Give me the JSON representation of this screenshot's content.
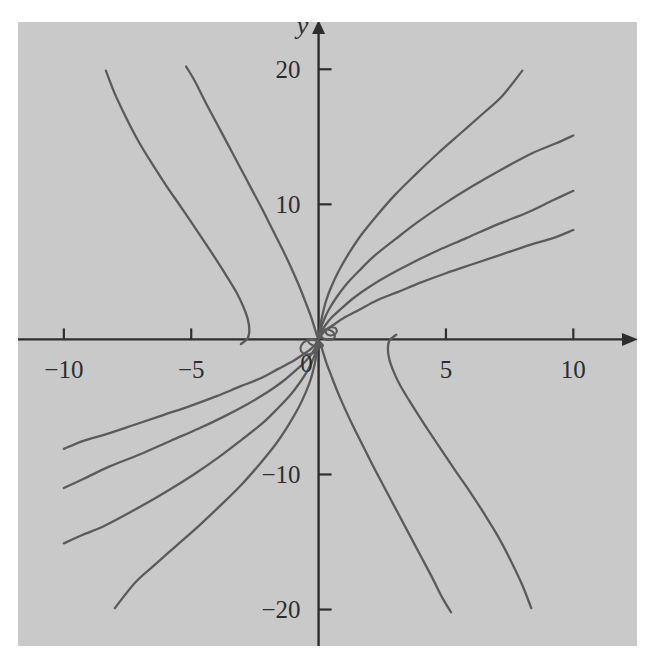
{
  "figure": {
    "background_color": "#ffffff",
    "plot_background_color": "#c9c9c9",
    "axis_color": "#2e2e2e",
    "curve_color": "#5b5b5b"
  },
  "axes": {
    "x_axis_label": "x",
    "y_axis_label": "y",
    "origin_label": "0",
    "x_ticks": [
      {
        "value": -10,
        "label": "−10"
      },
      {
        "value": -5,
        "label": "−5"
      },
      {
        "value": 5,
        "label": "5"
      },
      {
        "value": 10,
        "label": "10"
      }
    ],
    "y_ticks": [
      {
        "value": 20,
        "label": "20"
      },
      {
        "value": 10,
        "label": "10"
      },
      {
        "value": -10,
        "label": "−10"
      },
      {
        "value": -20,
        "label": "−20"
      }
    ]
  },
  "chart_data": {
    "type": "line",
    "title": "",
    "xlabel": "x",
    "ylabel": "y",
    "xlim": [
      -11.8,
      12.5
    ],
    "ylim": [
      -22.7,
      23.5
    ],
    "grid": false,
    "legend": null,
    "series": [
      {
        "name": "branch-1-upper-right",
        "comment": "steepest branch from origin to (8, 20)",
        "points": [
          [
            0.02,
            0.35
          ],
          [
            0.06,
            0.9
          ],
          [
            0.15,
            1.8
          ],
          [
            0.3,
            2.9
          ],
          [
            0.5,
            3.9
          ],
          [
            0.8,
            5.1
          ],
          [
            1.2,
            6.4
          ],
          [
            1.7,
            7.8
          ],
          [
            2.3,
            9.2
          ],
          [
            3.0,
            10.7
          ],
          [
            3.8,
            12.2
          ],
          [
            4.7,
            13.8
          ],
          [
            5.6,
            15.3
          ],
          [
            6.5,
            16.8
          ],
          [
            7.2,
            18.0
          ],
          [
            8.0,
            19.9
          ]
        ]
      },
      {
        "name": "branch-2-upper-right",
        "comment": "from origin to (10, 15)",
        "points": [
          [
            0.02,
            0.2
          ],
          [
            0.08,
            0.7
          ],
          [
            0.2,
            1.4
          ],
          [
            0.4,
            2.2
          ],
          [
            0.7,
            3.1
          ],
          [
            1.1,
            4.1
          ],
          [
            1.6,
            5.1
          ],
          [
            2.2,
            6.2
          ],
          [
            3.0,
            7.4
          ],
          [
            3.9,
            8.7
          ],
          [
            4.9,
            10.0
          ],
          [
            6.0,
            11.3
          ],
          [
            7.2,
            12.6
          ],
          [
            8.4,
            13.8
          ],
          [
            9.3,
            14.5
          ],
          [
            10.0,
            15.1
          ]
        ]
      },
      {
        "name": "branch-3-upper-right",
        "comment": "from origin to (10, 11)",
        "points": [
          [
            0.02,
            0.1
          ],
          [
            0.1,
            0.5
          ],
          [
            0.25,
            1.0
          ],
          [
            0.5,
            1.6
          ],
          [
            0.9,
            2.3
          ],
          [
            1.4,
            3.1
          ],
          [
            2.0,
            3.9
          ],
          [
            2.8,
            4.8
          ],
          [
            3.7,
            5.7
          ],
          [
            4.7,
            6.6
          ],
          [
            5.8,
            7.5
          ],
          [
            7.0,
            8.5
          ],
          [
            8.2,
            9.4
          ],
          [
            9.2,
            10.3
          ],
          [
            10.0,
            11.0
          ]
        ]
      },
      {
        "name": "branch-4-upper-right",
        "comment": "from origin to (10, 8)",
        "points": [
          [
            0.02,
            0.05
          ],
          [
            0.12,
            0.35
          ],
          [
            0.3,
            0.7
          ],
          [
            0.6,
            1.1
          ],
          [
            1.0,
            1.6
          ],
          [
            1.6,
            2.2
          ],
          [
            2.3,
            2.9
          ],
          [
            3.1,
            3.5
          ],
          [
            4.0,
            4.2
          ],
          [
            5.0,
            4.9
          ],
          [
            6.1,
            5.6
          ],
          [
            7.2,
            6.3
          ],
          [
            8.3,
            7.0
          ],
          [
            9.2,
            7.5
          ],
          [
            10.0,
            8.1
          ]
        ]
      },
      {
        "name": "branch-fold-right",
        "comment": "fold branch: vertical tangent near x = 2.7 on x-axis, descends to (8, -20)",
        "points": [
          [
            3.05,
            0.35
          ],
          [
            2.78,
            -0.1
          ],
          [
            2.72,
            -0.7
          ],
          [
            2.78,
            -1.5
          ],
          [
            2.95,
            -2.4
          ],
          [
            3.2,
            -3.4
          ],
          [
            3.55,
            -4.5
          ],
          [
            3.95,
            -5.7
          ],
          [
            4.4,
            -7.0
          ],
          [
            4.9,
            -8.4
          ],
          [
            5.4,
            -9.8
          ],
          [
            5.95,
            -11.3
          ],
          [
            6.5,
            -12.9
          ],
          [
            7.05,
            -14.6
          ],
          [
            7.55,
            -16.4
          ],
          [
            8.0,
            -18.2
          ],
          [
            8.35,
            -19.9
          ]
        ]
      },
      {
        "name": "branch-steep-right-down",
        "comment": "from origin steeply down to (5, -20)",
        "points": [
          [
            0.05,
            -0.2
          ],
          [
            0.15,
            -0.8
          ],
          [
            0.3,
            -1.7
          ],
          [
            0.5,
            -2.7
          ],
          [
            0.75,
            -3.9
          ],
          [
            1.05,
            -5.2
          ],
          [
            1.4,
            -6.6
          ],
          [
            1.8,
            -8.1
          ],
          [
            2.2,
            -9.6
          ],
          [
            2.65,
            -11.2
          ],
          [
            3.1,
            -12.8
          ],
          [
            3.55,
            -14.4
          ],
          [
            4.0,
            -16.0
          ],
          [
            4.45,
            -17.6
          ],
          [
            4.85,
            -19.1
          ],
          [
            5.2,
            -20.2
          ]
        ]
      },
      {
        "name": "branch-1-lower-left",
        "comment": "mirror of branch-1: origin to (-8, -20)",
        "points": [
          [
            -0.02,
            -0.35
          ],
          [
            -0.06,
            -0.9
          ],
          [
            -0.15,
            -1.8
          ],
          [
            -0.3,
            -2.9
          ],
          [
            -0.5,
            -3.9
          ],
          [
            -0.8,
            -5.1
          ],
          [
            -1.2,
            -6.4
          ],
          [
            -1.7,
            -7.8
          ],
          [
            -2.3,
            -9.2
          ],
          [
            -3.0,
            -10.7
          ],
          [
            -3.8,
            -12.2
          ],
          [
            -4.7,
            -13.8
          ],
          [
            -5.6,
            -15.3
          ],
          [
            -6.5,
            -16.8
          ],
          [
            -7.2,
            -18.0
          ],
          [
            -8.0,
            -19.9
          ]
        ]
      },
      {
        "name": "branch-2-lower-left",
        "comment": "mirror of branch-2: origin to (-10, -15)",
        "points": [
          [
            -0.02,
            -0.2
          ],
          [
            -0.08,
            -0.7
          ],
          [
            -0.2,
            -1.4
          ],
          [
            -0.4,
            -2.2
          ],
          [
            -0.7,
            -3.1
          ],
          [
            -1.1,
            -4.1
          ],
          [
            -1.6,
            -5.1
          ],
          [
            -2.2,
            -6.2
          ],
          [
            -3.0,
            -7.4
          ],
          [
            -3.9,
            -8.7
          ],
          [
            -4.9,
            -10.0
          ],
          [
            -6.0,
            -11.3
          ],
          [
            -7.2,
            -12.6
          ],
          [
            -8.4,
            -13.8
          ],
          [
            -9.3,
            -14.5
          ],
          [
            -10.0,
            -15.1
          ]
        ]
      },
      {
        "name": "branch-3-lower-left",
        "comment": "mirror of branch-3: origin to (-10, -11)",
        "points": [
          [
            -0.02,
            -0.1
          ],
          [
            -0.1,
            -0.5
          ],
          [
            -0.25,
            -1.0
          ],
          [
            -0.5,
            -1.6
          ],
          [
            -0.9,
            -2.3
          ],
          [
            -1.4,
            -3.1
          ],
          [
            -2.0,
            -3.9
          ],
          [
            -2.8,
            -4.8
          ],
          [
            -3.7,
            -5.7
          ],
          [
            -4.7,
            -6.6
          ],
          [
            -5.8,
            -7.5
          ],
          [
            -7.0,
            -8.5
          ],
          [
            -8.2,
            -9.4
          ],
          [
            -9.2,
            -10.3
          ],
          [
            -10.0,
            -11.0
          ]
        ]
      },
      {
        "name": "branch-4-lower-left",
        "comment": "mirror of branch-4: origin to (-10, -8)",
        "points": [
          [
            -0.02,
            -0.05
          ],
          [
            -0.12,
            -0.35
          ],
          [
            -0.3,
            -0.7
          ],
          [
            -0.6,
            -1.1
          ],
          [
            -1.0,
            -1.6
          ],
          [
            -1.6,
            -2.2
          ],
          [
            -2.3,
            -2.9
          ],
          [
            -3.1,
            -3.5
          ],
          [
            -4.0,
            -4.2
          ],
          [
            -5.0,
            -4.9
          ],
          [
            -6.1,
            -5.6
          ],
          [
            -7.2,
            -6.3
          ],
          [
            -8.3,
            -7.0
          ],
          [
            -9.2,
            -7.5
          ],
          [
            -10.0,
            -8.1
          ]
        ]
      },
      {
        "name": "branch-fold-left",
        "comment": "fold branch: vertical tangent near x = -2.7 on x-axis, rises to (-8, 20)",
        "points": [
          [
            -3.05,
            -0.35
          ],
          [
            -2.78,
            0.1
          ],
          [
            -2.72,
            0.7
          ],
          [
            -2.78,
            1.5
          ],
          [
            -2.95,
            2.4
          ],
          [
            -3.2,
            3.4
          ],
          [
            -3.55,
            4.5
          ],
          [
            -3.95,
            5.7
          ],
          [
            -4.4,
            7.0
          ],
          [
            -4.9,
            8.4
          ],
          [
            -5.4,
            9.8
          ],
          [
            -5.95,
            11.3
          ],
          [
            -6.5,
            12.9
          ],
          [
            -7.05,
            14.6
          ],
          [
            -7.55,
            16.4
          ],
          [
            -8.0,
            18.2
          ],
          [
            -8.35,
            19.9
          ]
        ]
      },
      {
        "name": "branch-steep-left-up",
        "comment": "mirror: from origin steeply up to (-5, 20)",
        "points": [
          [
            -0.05,
            0.2
          ],
          [
            -0.15,
            0.8
          ],
          [
            -0.3,
            1.7
          ],
          [
            -0.5,
            2.7
          ],
          [
            -0.75,
            3.9
          ],
          [
            -1.05,
            5.2
          ],
          [
            -1.4,
            6.6
          ],
          [
            -1.8,
            8.1
          ],
          [
            -2.2,
            9.6
          ],
          [
            -2.65,
            11.2
          ],
          [
            -3.1,
            12.8
          ],
          [
            -3.55,
            14.4
          ],
          [
            -4.0,
            16.0
          ],
          [
            -4.45,
            17.6
          ],
          [
            -4.85,
            19.1
          ],
          [
            -5.2,
            20.2
          ]
        ]
      }
    ],
    "origin_node": {
      "comment": "small cusped loops clustered at the origin",
      "loops": [
        {
          "cx": -0.35,
          "cy": -0.55,
          "rx": 0.38,
          "ry": 0.52,
          "rot": -25
        },
        {
          "cx": -0.12,
          "cy": -0.3,
          "rx": 0.3,
          "ry": 0.22,
          "rot": 20
        },
        {
          "cx": 0.35,
          "cy": 0.35,
          "rx": 0.3,
          "ry": 0.38,
          "rot": 15
        },
        {
          "cx": 0.5,
          "cy": 0.6,
          "rx": 0.22,
          "ry": 0.3,
          "rot": -10
        }
      ]
    }
  }
}
